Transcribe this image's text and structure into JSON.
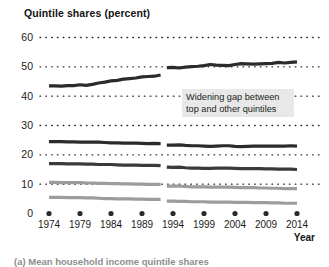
{
  "figure": {
    "title": "Quintile shares (percent)",
    "axis_label_x": "Year",
    "caption": "(a) Mean household income quintile shares",
    "annotation": "Widening gap between top and other quintiles"
  },
  "colors": {
    "series_dark": "#2b2b2b",
    "series_mid": "#3a3a3a",
    "gridline": "#2b2b2b",
    "annotation_background": "#e8e8e8",
    "text": "#1b1b1b",
    "background": "#ffffff"
  },
  "chart_data": {
    "type": "line",
    "title": "Quintile shares (percent)",
    "xlabel": "Year",
    "ylabel": "Quintile shares (percent)",
    "xlim": [
      1974,
      2014
    ],
    "ylim": [
      0,
      60
    ],
    "yticks": [
      0,
      10,
      20,
      30,
      40,
      50,
      60
    ],
    "xticks": [
      1974,
      1979,
      1984,
      1989,
      1994,
      1999,
      2004,
      2009,
      2014
    ],
    "grid": "dotted-horizontal",
    "legend": "none",
    "series_break_after_year": 1992,
    "x": [
      1974,
      1975,
      1976,
      1977,
      1978,
      1979,
      1980,
      1981,
      1982,
      1983,
      1984,
      1985,
      1986,
      1987,
      1988,
      1989,
      1990,
      1991,
      1992,
      1993,
      1994,
      1995,
      1996,
      1997,
      1998,
      1999,
      2000,
      2001,
      2002,
      2003,
      2004,
      2005,
      2006,
      2007,
      2008,
      2009,
      2010,
      2011,
      2012,
      2013,
      2014
    ],
    "series": [
      {
        "name": "Top quintile",
        "color": "#2b2b2b",
        "values": [
          43.5,
          43.5,
          43.4,
          43.6,
          43.6,
          43.9,
          43.7,
          44.0,
          44.5,
          44.8,
          45.2,
          45.4,
          45.8,
          46.0,
          46.2,
          46.6,
          46.7,
          46.8,
          47.2,
          49.7,
          49.8,
          49.6,
          49.9,
          50.1,
          50.2,
          50.4,
          50.8,
          50.6,
          50.5,
          50.4,
          50.8,
          51.1,
          51.0,
          50.9,
          51.0,
          51.1,
          51.2,
          51.5,
          51.3,
          51.5,
          51.7
        ]
      },
      {
        "name": "Fourth quintile",
        "color": "#2b2b2b",
        "values": [
          24.5,
          24.5,
          24.5,
          24.4,
          24.4,
          24.3,
          24.3,
          24.3,
          24.3,
          24.2,
          24.1,
          24.1,
          24.0,
          24.0,
          24.0,
          23.9,
          23.8,
          23.9,
          23.8,
          23.3,
          23.3,
          23.4,
          23.2,
          23.1,
          23.1,
          23.0,
          22.9,
          23.0,
          23.1,
          23.1,
          22.9,
          22.8,
          22.9,
          23.0,
          23.0,
          23.0,
          23.0,
          23.0,
          23.0,
          23.1,
          23.0
        ]
      },
      {
        "name": "Third quintile",
        "color": "#3a3a3a",
        "values": [
          17.0,
          17.0,
          17.0,
          16.9,
          16.9,
          16.9,
          16.8,
          16.8,
          16.7,
          16.7,
          16.7,
          16.6,
          16.5,
          16.5,
          16.5,
          16.4,
          16.4,
          16.4,
          16.3,
          15.8,
          15.7,
          15.8,
          15.6,
          15.5,
          15.5,
          15.4,
          15.4,
          15.5,
          15.5,
          15.5,
          15.4,
          15.3,
          15.3,
          15.3,
          15.3,
          15.2,
          15.2,
          15.1,
          15.1,
          15.1,
          15.0
        ]
      },
      {
        "name": "Second quintile",
        "color": "#9c9c9c",
        "values": [
          10.6,
          10.6,
          10.5,
          10.5,
          10.5,
          10.5,
          10.4,
          10.4,
          10.3,
          10.3,
          10.2,
          10.2,
          10.1,
          10.1,
          10.0,
          10.0,
          9.9,
          9.9,
          9.9,
          9.3,
          9.3,
          9.3,
          9.2,
          9.1,
          9.1,
          9.1,
          9.0,
          9.0,
          9.0,
          9.0,
          8.9,
          8.8,
          8.8,
          8.8,
          8.7,
          8.7,
          8.6,
          8.6,
          8.5,
          8.5,
          8.5
        ]
      },
      {
        "name": "Bottom quintile",
        "color": "#9c9c9c",
        "values": [
          5.5,
          5.5,
          5.5,
          5.4,
          5.4,
          5.4,
          5.3,
          5.3,
          5.2,
          5.1,
          5.1,
          5.0,
          5.0,
          5.0,
          4.9,
          4.9,
          4.8,
          4.8,
          4.8,
          4.2,
          4.2,
          4.1,
          4.1,
          4.0,
          4.0,
          4.0,
          3.9,
          3.9,
          3.9,
          3.9,
          3.8,
          3.8,
          3.8,
          3.7,
          3.7,
          3.7,
          3.6,
          3.6,
          3.5,
          3.5,
          3.5
        ]
      }
    ]
  }
}
